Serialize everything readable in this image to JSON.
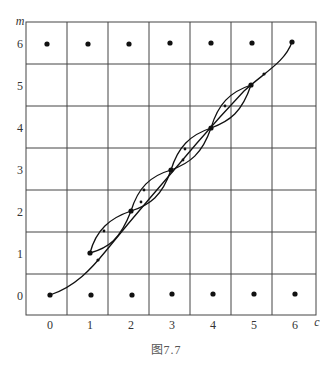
{
  "figure": {
    "caption": "图7.7",
    "x_axis": {
      "name": "c",
      "ticks": [
        "0",
        "1",
        "2",
        "3",
        "4",
        "5",
        "6"
      ]
    },
    "y_axis": {
      "name": "m",
      "ticks": [
        "0",
        "1",
        "2",
        "3",
        "4",
        "5",
        "6"
      ]
    },
    "grid": {
      "columns": 7,
      "rows": 7
    },
    "lattice_points": [
      [
        0,
        6
      ],
      [
        1,
        6
      ],
      [
        2,
        6
      ],
      [
        3,
        6
      ],
      [
        4,
        6
      ],
      [
        5,
        6
      ],
      [
        6,
        6
      ],
      [
        0,
        0
      ],
      [
        1,
        0
      ],
      [
        2,
        0
      ],
      [
        3,
        0
      ],
      [
        4,
        0
      ],
      [
        5,
        0
      ],
      [
        6,
        0
      ],
      [
        1,
        1
      ],
      [
        2,
        2
      ],
      [
        3,
        3
      ],
      [
        4,
        4
      ],
      [
        5,
        5
      ]
    ],
    "paths": [
      {
        "name": "main-path",
        "from": [
          0,
          0
        ],
        "to": [
          6,
          6
        ],
        "note": "long curve along diagonal with arrows"
      },
      {
        "name": "lens-1-2",
        "from": [
          1,
          1
        ],
        "to": [
          2,
          2
        ]
      },
      {
        "name": "lens-2-3",
        "from": [
          2,
          2
        ],
        "to": [
          3,
          3
        ]
      },
      {
        "name": "lens-3-4",
        "from": [
          3,
          3
        ],
        "to": [
          4,
          4
        ]
      },
      {
        "name": "lens-4-5",
        "from": [
          4,
          4
        ],
        "to": [
          5,
          5
        ]
      }
    ]
  }
}
